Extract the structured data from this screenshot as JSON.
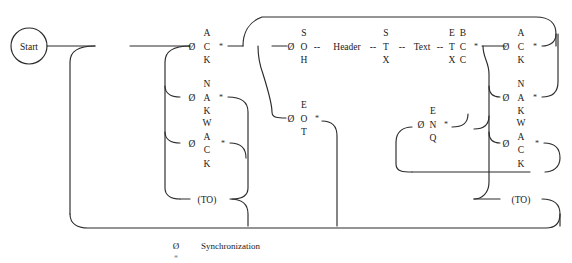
{
  "diagram": {
    "type": "state-transition-flow",
    "start_node": {
      "label": "Start"
    },
    "sync_symbol": "Ø",
    "timeout_label": "(TO)",
    "branch_marker": "*",
    "dash_connector": "--",
    "nodes": [
      {
        "id": "enq",
        "stack": [
          "E",
          "N",
          "Q"
        ],
        "sync": true,
        "star": true,
        "x": 112,
        "y": 46
      },
      {
        "id": "ack1",
        "stack": [
          "A",
          "C",
          "K"
        ],
        "sync": true,
        "star": true,
        "x": 207,
        "y": 46
      },
      {
        "id": "nak1",
        "stack": [
          "N",
          "A",
          "K"
        ],
        "sync": true,
        "star": true,
        "x": 207,
        "y": 97
      },
      {
        "id": "wack1",
        "stack": [
          "W",
          "A",
          "C",
          "K"
        ],
        "sync": true,
        "star": true,
        "x": 207,
        "y": 143
      },
      {
        "id": "to1",
        "stack": [
          "(TO)"
        ],
        "sync": false,
        "star": false,
        "x": 207,
        "y": 199
      },
      {
        "id": "soh",
        "stack": [
          "S",
          "O",
          "H"
        ],
        "sync": true,
        "star": false,
        "x": 303,
        "y": 46
      },
      {
        "id": "header",
        "stack": [
          "Header"
        ],
        "sync": false,
        "star": false,
        "x": 340,
        "y": 46
      },
      {
        "id": "stx",
        "stack": [
          "S",
          "T",
          "X"
        ],
        "sync": false,
        "star": false,
        "x": 373,
        "y": 46
      },
      {
        "id": "text",
        "stack": [
          "Text"
        ],
        "sync": false,
        "star": false,
        "x": 404,
        "y": 46
      },
      {
        "id": "etx",
        "stack": [
          "E",
          "T",
          "X"
        ],
        "sync": false,
        "star": false,
        "x": 430,
        "y": 46
      },
      {
        "id": "bcc",
        "stack": [
          "B",
          "C",
          "C"
        ],
        "sync": false,
        "star": true,
        "x": 443,
        "y": 46
      },
      {
        "id": "eot",
        "stack": [
          "E",
          "O",
          "T"
        ],
        "sync": true,
        "star": true,
        "x": 303,
        "y": 118
      },
      {
        "id": "enq2",
        "stack": [
          "E",
          "N",
          "Q"
        ],
        "sync": true,
        "star": true,
        "x": 432,
        "y": 124
      },
      {
        "id": "ack2",
        "stack": [
          "A",
          "C",
          "K"
        ],
        "sync": true,
        "star": true,
        "x": 521,
        "y": 46
      },
      {
        "id": "nak2",
        "stack": [
          "N",
          "A",
          "K"
        ],
        "sync": true,
        "star": true,
        "x": 521,
        "y": 97
      },
      {
        "id": "wack2",
        "stack": [
          "W",
          "A",
          "C",
          "K"
        ],
        "sync": true,
        "star": true,
        "x": 521,
        "y": 143
      },
      {
        "id": "to2",
        "stack": [
          "(TO)"
        ],
        "sync": false,
        "star": false,
        "x": 521,
        "y": 199
      }
    ],
    "labels": {
      "start": "Start",
      "enq": "ENQ",
      "ack": "ACK",
      "nak": "NAK",
      "wack": "WACK",
      "soh": "SOH",
      "header": "Header",
      "stx": "STX",
      "text": "Text",
      "etx": "ETX",
      "bcc": "BCC",
      "eot": "EOT",
      "timeout": "(TO)"
    }
  },
  "legend": {
    "rows": [
      {
        "symbol": "Ø",
        "text": "Synchronization"
      },
      {
        "symbol": "*",
        "text": ""
      }
    ]
  },
  "colors": {
    "line": "#2b2b2b",
    "text": "#1a1a1a",
    "background": "#ffffff"
  }
}
